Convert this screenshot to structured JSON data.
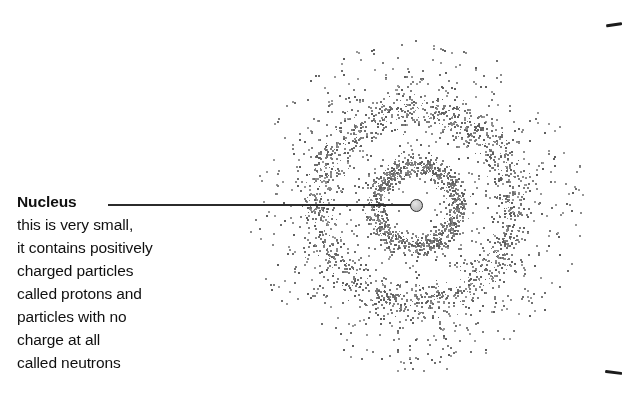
{
  "figure": {
    "background_color": "#ffffff"
  },
  "callout": {
    "title": "Nucleus",
    "lines": [
      "this is very small,",
      "it contains positively",
      "charged particles",
      "called protons and",
      "particles with no",
      "charge at all",
      "called neutrons"
    ]
  },
  "atom": {
    "nucleus_label": "nucleus",
    "nucleus_center": {
      "x": 416,
      "y": 205
    },
    "nucleus_radius": 6.5,
    "nucleus_fill": "#cccccc",
    "nucleus_stroke": "#2b2b2b",
    "dot_color": "#6f6f6f",
    "shells": [
      {
        "name": "inner-electron-shell",
        "radius": 41,
        "band_width": 16,
        "dot_count": 900
      },
      {
        "name": "outer-electron-shell",
        "radius": 98,
        "band_width": 26,
        "dot_count": 1200
      }
    ],
    "scatter": {
      "name": "electron-probability-cloud",
      "inner_radius": 14,
      "outer_radius": 168,
      "dot_count": 1150
    }
  },
  "leader": {
    "name": "nucleus-leader-line",
    "from_x": 108,
    "to_x": 411,
    "y": 205,
    "color": "#2b2b2b"
  },
  "edge_marks": {
    "top_label": "scan-edge-artifact-top",
    "bottom_label": "scan-edge-artifact-bottom",
    "color": "#1b1b1b"
  }
}
